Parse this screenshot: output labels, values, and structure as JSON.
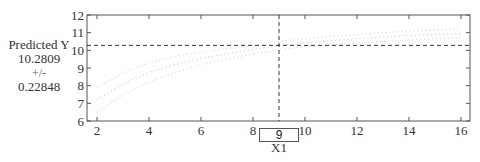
{
  "readout": {
    "title": "Predicted Y",
    "value": "10.2809",
    "plus_minus": "+/-",
    "interval": "0.22848"
  },
  "x_input": {
    "value": "9",
    "label": "X1"
  },
  "colors": {
    "axes": "#555555",
    "crosshair": "#333333",
    "curve": "#d9d9d9",
    "bounds": "#e2e2e2"
  },
  "chart_data": {
    "type": "line",
    "title": "",
    "xlabel": "X1",
    "ylabel": "Predicted Y",
    "xlim": [
      1.6,
      16.35
    ],
    "ylim": [
      6,
      12
    ],
    "x_ticks": [
      2,
      4,
      6,
      8,
      10,
      12,
      14,
      16
    ],
    "y_ticks": [
      6,
      7,
      8,
      9,
      10,
      11,
      12
    ],
    "grid": false,
    "crosshair": {
      "x": 9,
      "y": 10.2809,
      "half_width": 0.22848
    },
    "x": [
      2,
      3,
      4,
      5,
      6,
      7,
      8,
      9,
      10,
      11,
      12,
      13,
      14,
      15,
      16
    ],
    "series": [
      {
        "name": "Upper bound",
        "values": [
          7.9,
          8.7,
          9.3,
          9.65,
          9.9,
          10.1,
          10.25,
          10.51,
          10.65,
          10.8,
          10.9,
          11.0,
          11.1,
          11.15,
          11.2
        ]
      },
      {
        "name": "Predicted",
        "values": [
          7.2,
          8.1,
          8.75,
          9.2,
          9.55,
          9.8,
          10.05,
          10.28,
          10.42,
          10.55,
          10.65,
          10.75,
          10.85,
          10.9,
          10.95
        ]
      },
      {
        "name": "Lower bound",
        "values": [
          6.5,
          7.5,
          8.2,
          8.75,
          9.2,
          9.5,
          9.8,
          10.05,
          10.2,
          10.3,
          10.4,
          10.5,
          10.58,
          10.65,
          10.7
        ]
      }
    ],
    "legend": "none"
  }
}
